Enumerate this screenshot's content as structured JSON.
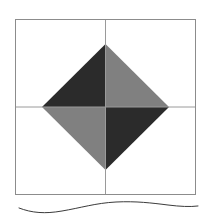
{
  "figure": {
    "name": "quilt-block-diagram",
    "canvas": {
      "width": 210,
      "height": 218
    },
    "background_color": "#ffffff"
  },
  "palette": {
    "white": "#ffffff",
    "off_white": "#fbfbfb",
    "very_light_gray": "#f0f0f0",
    "medium_gray": "#808080",
    "dark_gray": "#545454",
    "near_black": "#2b2b2b",
    "outline_gray": "#8c8c8c",
    "grid_gray": "#9a9a9a",
    "wave_ink": "#3b3b3b"
  },
  "block": {
    "name": "main-square",
    "bounds": {
      "x": 15,
      "y": 19,
      "width": 181,
      "height": 176
    },
    "center": {
      "x": 105.5,
      "y": 107
    },
    "outline_color": "#8c8c8c",
    "outline_width": 1,
    "grid_lines": [
      {
        "name": "vertical-center-seam",
        "x1": 105.5,
        "y1": 19,
        "x2": 105.5,
        "y2": 195
      },
      {
        "name": "horizontal-center-seam",
        "x1": 15,
        "y1": 107,
        "x2": 196,
        "y2": 107
      }
    ]
  },
  "quadrants": [
    {
      "name": "top-left-quadrant",
      "bounds": {
        "x": 15,
        "y": 19,
        "width": 90.5,
        "height": 88
      },
      "patches": [
        {
          "name": "corner-triangle",
          "fill": "#f0f0f0",
          "points": "15,19 105.5,19 15,107"
        },
        {
          "name": "diagonal-band",
          "fill": "#ffffff",
          "points": "15,19 105.5,19 105.5,44 42,107 15,107"
        },
        {
          "name": "center-diamond-triangle",
          "fill": "#2b2b2b",
          "points": "105.5,44 105.5,107 42,107"
        }
      ]
    },
    {
      "name": "top-right-quadrant",
      "bounds": {
        "x": 105.5,
        "y": 19,
        "width": 90.5,
        "height": 88
      },
      "patches": [
        {
          "name": "corner-triangle",
          "fill": "#2b2b2b",
          "points": "105.5,19 196,19 196,107"
        },
        {
          "name": "diagonal-band",
          "fill": "#ffffff",
          "points": "105.5,19 196,19 196,107 169,107 105.5,44"
        },
        {
          "name": "center-diamond-triangle",
          "fill": "#808080",
          "points": "105.5,44 169,107 105.5,107"
        }
      ]
    },
    {
      "name": "bottom-left-quadrant",
      "bounds": {
        "x": 15,
        "y": 107,
        "width": 90.5,
        "height": 88
      },
      "patches": [
        {
          "name": "corner-triangle",
          "fill": "#545454",
          "points": "15,107 15,195 105.5,195"
        },
        {
          "name": "diagonal-band",
          "fill": "#ffffff",
          "points": "15,107 42,107 105.5,170 105.5,195 15,195"
        },
        {
          "name": "center-diamond-triangle",
          "fill": "#808080",
          "points": "42,107 105.5,107 105.5,170"
        }
      ]
    },
    {
      "name": "bottom-right-quadrant",
      "bounds": {
        "x": 105.5,
        "y": 107,
        "width": 90.5,
        "height": 88
      },
      "patches": [
        {
          "name": "corner-triangle",
          "fill": "#808080",
          "points": "196,107 196,195 105.5,195"
        },
        {
          "name": "diagonal-band",
          "fill": "#ffffff",
          "points": "105.5,170 169,107 196,107 196,195 105.5,195"
        },
        {
          "name": "center-diamond-triangle",
          "fill": "#2b2b2b",
          "points": "105.5,107 169,107 105.5,170"
        }
      ]
    }
  ],
  "center_diamond": {
    "name": "on-point-center-square",
    "vertices": {
      "top": {
        "x": 105.5,
        "y": 44
      },
      "right": {
        "x": 169,
        "y": 107
      },
      "bottom": {
        "x": 105.5,
        "y": 170
      },
      "left": {
        "x": 42,
        "y": 107
      }
    },
    "triangle_fills": {
      "top_left": "#2b2b2b",
      "top_right": "#808080",
      "bottom_left": "#808080",
      "bottom_right": "#2b2b2b"
    }
  },
  "wave": {
    "name": "hand-drawn-wave-rule",
    "stroke": "#3b3b3b",
    "stroke_width": 1,
    "path": "M 19 208 C 32 213, 45 214, 62 211 C 80 208, 96 203, 116 202 C 136 201, 152 203, 168 205 C 180 206.5, 190 207, 198 206"
  }
}
